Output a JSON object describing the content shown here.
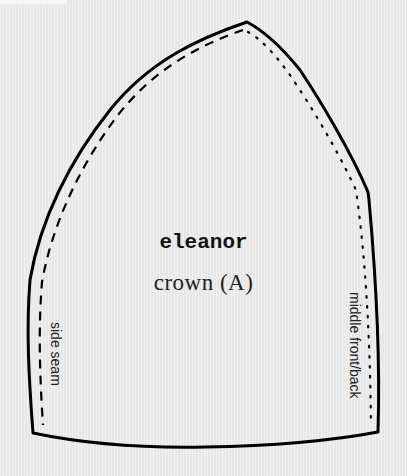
{
  "pattern": {
    "name": "eleanor",
    "piece": "crown (A)",
    "labels": {
      "left_edge": "side seam",
      "right_edge": "middle front/back"
    },
    "line_styles": {
      "outline": "solid",
      "side_seam_line": "dashed",
      "middle_front_back_line": "dotted"
    },
    "colors": {
      "background": "#ececec",
      "ink": "#000000"
    }
  }
}
